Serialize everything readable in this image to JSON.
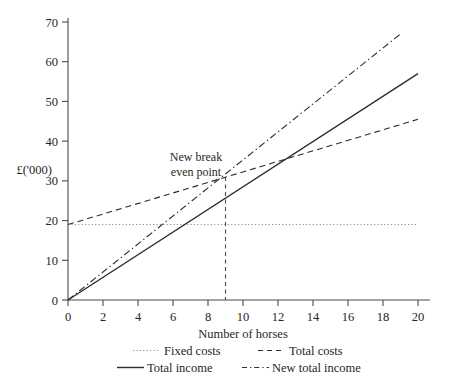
{
  "chart_data": {
    "type": "line",
    "title": "",
    "xlabel": "Number of horses",
    "ylabel": "£('000)",
    "xlim": [
      0,
      20
    ],
    "ylim": [
      0,
      70
    ],
    "xticks": [
      0,
      2,
      4,
      6,
      8,
      10,
      12,
      14,
      16,
      18,
      20
    ],
    "yticks": [
      0,
      10,
      20,
      30,
      40,
      50,
      60,
      70
    ],
    "grid": false,
    "legend_position": "below-axis",
    "series": [
      {
        "name": "Fixed costs",
        "style": "dotted",
        "x": [
          0,
          20
        ],
        "values": [
          19,
          19
        ]
      },
      {
        "name": "Total costs",
        "style": "dashed",
        "x": [
          0,
          20
        ],
        "values": [
          19,
          45.5
        ]
      },
      {
        "name": "Total income",
        "style": "solid",
        "x": [
          0,
          20
        ],
        "values": [
          0,
          57
        ]
      },
      {
        "name": "New total income",
        "style": "dash-dot",
        "x": [
          0,
          19
        ],
        "values": [
          0,
          67
        ]
      }
    ],
    "annotations": [
      {
        "name": "new-break-even-point",
        "lines": [
          "New break",
          "even point"
        ],
        "x": 9,
        "y": 31
      }
    ]
  },
  "axis": {
    "ylabel": "£('000)",
    "xlabel": "Number of horses",
    "ytick_labels": [
      "0",
      "10",
      "20",
      "30",
      "40",
      "50",
      "60",
      "70"
    ],
    "xtick_labels": [
      "0",
      "2",
      "4",
      "6",
      "8",
      "10",
      "12",
      "14",
      "16",
      "18",
      "20"
    ]
  },
  "legend": {
    "entries": [
      {
        "label": "Fixed costs",
        "style": "dotted"
      },
      {
        "label": "Total costs",
        "style": "dashed"
      },
      {
        "label": "Total income",
        "style": "solid"
      },
      {
        "label": "New total income",
        "style": "dash-dot"
      }
    ]
  },
  "annotation": {
    "line1": "New break",
    "line2": "even point"
  },
  "colors": {
    "ink": "#2b2b2b",
    "axis": "#4a4a4a",
    "fixed_costs": "#8c8c8c",
    "background": "#ffffff"
  }
}
